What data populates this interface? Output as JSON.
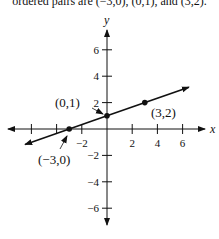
{
  "caption": "ordered pairs are (−3,0), (0,1), and (3,2).",
  "chart_data": {
    "type": "line",
    "title": "",
    "xlabel": "x",
    "ylabel": "y",
    "xlim": [
      -7,
      7
    ],
    "ylim": [
      -7,
      7
    ],
    "x_ticks": [
      -6,
      -4,
      -2,
      2,
      4,
      6
    ],
    "x_tick_labels": [
      "",
      "",
      "−2",
      "2",
      "4",
      "6"
    ],
    "y_ticks": [
      -6,
      -4,
      -2,
      2,
      4,
      6
    ],
    "y_tick_labels": [
      "−6",
      "−4",
      "−2",
      "2",
      "4",
      "6"
    ],
    "grid": false,
    "series": [
      {
        "name": "line",
        "x": [
          -6.5,
          6.5
        ],
        "y": [
          -1.1667,
          3.1667
        ],
        "equation": "y = x/3 + 1"
      }
    ],
    "points": [
      {
        "x": -3,
        "y": 0,
        "label": "(−3,0)"
      },
      {
        "x": 0,
        "y": 1,
        "label": "(0,1)"
      },
      {
        "x": 3,
        "y": 2,
        "label": "(3,2)"
      }
    ]
  }
}
